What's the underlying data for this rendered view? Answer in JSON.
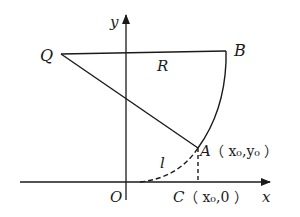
{
  "diagram": {
    "type": "geometry-coordinate-figure",
    "axes": {
      "x_label": "x",
      "y_label": "y",
      "origin_label": "O"
    },
    "points": {
      "Q": {
        "label": "Q"
      },
      "B": {
        "label": "B"
      },
      "A": {
        "label": "A",
        "coords_text": "（ x₀,y₀ ）"
      },
      "C": {
        "label": "C",
        "coords_text": "（ x₀,0 ）"
      }
    },
    "segment_labels": {
      "radius": "R",
      "curve": "l"
    },
    "colors": {
      "stroke": "#1a1a1a",
      "background": "#ffffff"
    }
  }
}
